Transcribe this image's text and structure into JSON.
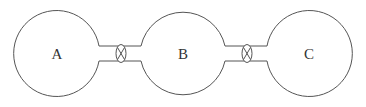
{
  "diagram": {
    "title": "",
    "stroke_color": "#555555",
    "nodes": [
      {
        "id": "A",
        "label": "A",
        "cx": 57,
        "cy": 53,
        "r": 43
      },
      {
        "id": "B",
        "label": "B",
        "cx": 183,
        "cy": 53,
        "r": 43
      },
      {
        "id": "C",
        "label": "C",
        "cx": 309,
        "cy": 53,
        "r": 43
      }
    ],
    "connections": [
      {
        "from": "A",
        "to": "B",
        "type": "pipe-with-valve",
        "valve_x": 121
      },
      {
        "from": "B",
        "to": "C",
        "type": "pipe-with-valve",
        "valve_x": 247
      }
    ]
  }
}
